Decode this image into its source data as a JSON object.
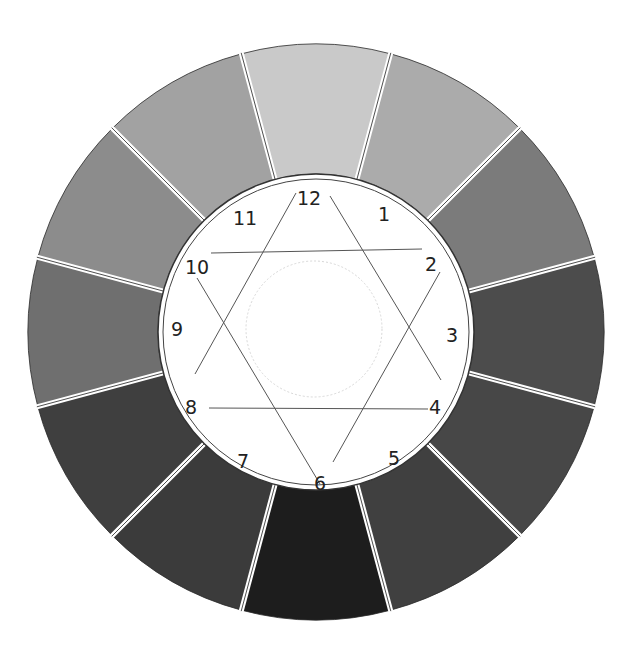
{
  "diagram": {
    "type": "color-wheel-grayscale",
    "center": [
      316,
      332
    ],
    "outer_radius": 288,
    "inner_radius": 158,
    "core_circle_radius": 68,
    "segments": [
      {
        "position": 12,
        "angle": 0,
        "color": "#c9c9c9"
      },
      {
        "position": 1,
        "angle": 30,
        "color": "#ababab"
      },
      {
        "position": 2,
        "angle": 60,
        "color": "#7b7b7b"
      },
      {
        "position": 3,
        "angle": 90,
        "color": "#4c4c4c"
      },
      {
        "position": 4,
        "angle": 120,
        "color": "#474747"
      },
      {
        "position": 5,
        "angle": 150,
        "color": "#404040"
      },
      {
        "position": 6,
        "angle": 180,
        "color": "#1d1d1d"
      },
      {
        "position": 7,
        "angle": 210,
        "color": "#3b3b3b"
      },
      {
        "position": 8,
        "angle": 240,
        "color": "#3f3f3f"
      },
      {
        "position": 9,
        "angle": 270,
        "color": "#6f6f6f"
      },
      {
        "position": 10,
        "angle": 300,
        "color": "#8c8c8c"
      },
      {
        "position": 11,
        "angle": 330,
        "color": "#a2a2a2"
      }
    ],
    "labels": [
      {
        "text": "12",
        "x": 309,
        "y": 199
      },
      {
        "text": "1",
        "x": 384,
        "y": 215
      },
      {
        "text": "2",
        "x": 431,
        "y": 265
      },
      {
        "text": "3",
        "x": 452,
        "y": 336
      },
      {
        "text": "4",
        "x": 435,
        "y": 408
      },
      {
        "text": "5",
        "x": 394,
        "y": 459
      },
      {
        "text": "6",
        "x": 320,
        "y": 484
      },
      {
        "text": "7",
        "x": 243,
        "y": 462
      },
      {
        "text": "8",
        "x": 191,
        "y": 408
      },
      {
        "text": "9",
        "x": 177,
        "y": 330
      },
      {
        "text": "10",
        "x": 197,
        "y": 268
      },
      {
        "text": "11",
        "x": 245,
        "y": 219
      }
    ],
    "hexagram": {
      "triangle_up": [
        [
          296,
          195
        ],
        [
          190,
          398
        ],
        [
          440,
          398
        ]
      ],
      "triangle_down": [
        [
          198,
          276
        ],
        [
          438,
          276
        ],
        [
          327,
          478
        ]
      ],
      "lines": [
        {
          "from": [
            211,
            253
          ],
          "to": [
            422,
            249
          ]
        },
        {
          "from": [
            209,
            408
          ],
          "to": [
            428,
            409
          ]
        },
        {
          "from": [
            296,
            193
          ],
          "to": [
            195,
            374
          ]
        },
        {
          "from": [
            330,
            196
          ],
          "to": [
            441,
            380
          ]
        },
        {
          "from": [
            197,
            278
          ],
          "to": [
            320,
            484
          ]
        },
        {
          "from": [
            440,
            272
          ],
          "to": [
            333,
            462
          ]
        }
      ]
    },
    "line_color": "#555555",
    "separator_color": "#ffffff"
  }
}
